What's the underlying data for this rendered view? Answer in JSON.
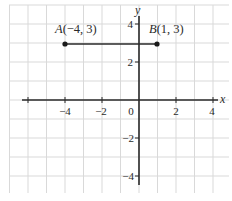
{
  "chart_data": {
    "type": "scatter",
    "title": "",
    "xlabel": "x",
    "ylabel": "y",
    "xlim": [
      -7,
      5
    ],
    "ylim": [
      -5,
      5
    ],
    "grid": true,
    "x_ticks": [
      -6,
      -4,
      -2,
      2,
      4
    ],
    "x_tick_labels": [
      "",
      "−4",
      "−2",
      "2",
      "4"
    ],
    "y_ticks": [
      -4,
      -2,
      2,
      4
    ],
    "y_tick_labels": [
      "−4",
      "−2",
      "2",
      "4"
    ],
    "origin_label": "0",
    "points": [
      {
        "name": "A",
        "x": -4,
        "y": 3,
        "label": "A(−4, 3)"
      },
      {
        "name": "B",
        "x": 1,
        "y": 3,
        "label": "B(1, 3)"
      }
    ],
    "segments": [
      {
        "from": "A",
        "to": "B"
      }
    ]
  },
  "labels": {
    "x_axis": "x",
    "y_axis": "y",
    "origin": "0",
    "point_a": "A(−4, 3)",
    "point_b": "B(1, 3)",
    "tick_x_neg4": "−4",
    "tick_x_neg2": "−2",
    "tick_x_2": "2",
    "tick_x_4": "4",
    "tick_y_4": "4",
    "tick_y_2": "2",
    "tick_y_neg2": "−2",
    "tick_y_neg4": "−4"
  },
  "colors": {
    "grid": "#d9d9d9",
    "axis": "#2a2a2a",
    "point": "#1a1a1a"
  }
}
